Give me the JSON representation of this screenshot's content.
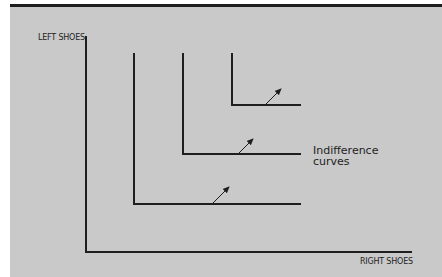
{
  "diagram": {
    "y_axis_label": "LEFT SHOES",
    "x_axis_label": "RIGHT SHOES",
    "annotation": {
      "line1": "Indifference",
      "line2": "curves"
    },
    "curve_count": 3,
    "colors": {
      "background": "#c9c9c9",
      "ink": "#1e1e1e"
    }
  }
}
